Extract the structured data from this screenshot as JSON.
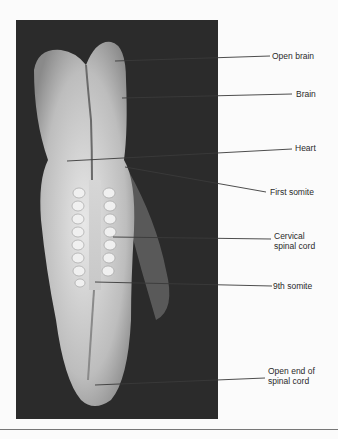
{
  "figure": {
    "labels": [
      {
        "id": "open-brain",
        "text": "Open brain"
      },
      {
        "id": "brain",
        "text": "Brain"
      },
      {
        "id": "heart",
        "text": "Heart"
      },
      {
        "id": "first-somite",
        "text": "First somite"
      },
      {
        "id": "cervical-spinal-cord",
        "line1": "Cervical",
        "line2": "spinal cord"
      },
      {
        "id": "ninth-somite",
        "text": "9th somite"
      },
      {
        "id": "open-end-spinal-cord",
        "line1": "Open end of",
        "line2": "spinal cord"
      }
    ]
  }
}
